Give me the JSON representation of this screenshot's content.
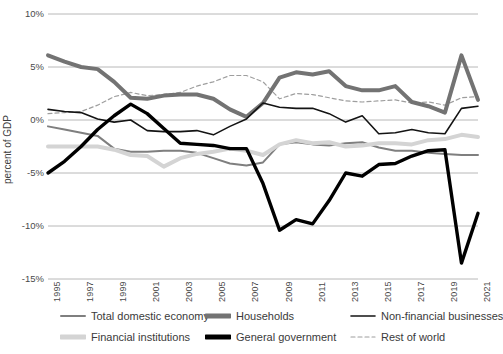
{
  "chart_data": {
    "type": "line",
    "title": "",
    "xlabel": "",
    "ylabel": "percent of GDP",
    "ylim": [
      -15,
      10
    ],
    "xlim": [
      1995,
      2021
    ],
    "grid": true,
    "legend_position": "bottom",
    "ytick_labels": [
      "10%",
      "5%",
      "0%",
      "-5%",
      "-10%",
      "-15%"
    ],
    "ytick_values": [
      10,
      5,
      0,
      -5,
      -10,
      -15
    ],
    "xtick_labels": [
      "1995",
      "1997",
      "1999",
      "2001",
      "2003",
      "2005",
      "2007",
      "2009",
      "2011",
      "2013",
      "2015",
      "2017",
      "2019",
      "2021"
    ],
    "x": [
      1995,
      1996,
      1997,
      1998,
      1999,
      2000,
      2001,
      2002,
      2003,
      2004,
      2005,
      2006,
      2007,
      2008,
      2009,
      2010,
      2011,
      2012,
      2013,
      2014,
      2015,
      2016,
      2017,
      2018,
      2019,
      2020,
      2021
    ],
    "series": [
      {
        "name": "Total domestic economy",
        "color": "#7f7f7f",
        "style": "solid",
        "width": 2,
        "values": [
          -0.6,
          -0.9,
          -1.2,
          -1.5,
          -2.7,
          -3.0,
          -3.0,
          -2.9,
          -2.9,
          -3.1,
          -3.6,
          -4.1,
          -4.3,
          -4.0,
          -2.3,
          -2.1,
          -2.3,
          -2.4,
          -2.2,
          -2.1,
          -2.6,
          -2.9,
          -2.9,
          -3.1,
          -3.2,
          -3.3,
          -3.3
        ]
      },
      {
        "name": "Households",
        "color": "#737373",
        "style": "solid",
        "width": 4,
        "values": [
          6.1,
          5.5,
          5.0,
          4.8,
          3.6,
          2.1,
          2.0,
          2.3,
          2.4,
          2.4,
          2.0,
          1.0,
          0.3,
          1.6,
          4.0,
          4.5,
          4.3,
          4.6,
          3.2,
          2.8,
          2.8,
          3.2,
          1.7,
          1.3,
          0.7,
          6.1,
          1.9
        ]
      },
      {
        "name": "Non-financial businesses",
        "color": "#141414",
        "style": "solid",
        "width": 1.6,
        "values": [
          1.0,
          0.8,
          0.7,
          0.1,
          -0.2,
          0.0,
          -1.0,
          -1.1,
          -1.1,
          -1.0,
          -1.4,
          -0.6,
          0.1,
          1.6,
          1.2,
          1.1,
          1.1,
          0.6,
          -0.2,
          0.4,
          -1.3,
          -1.2,
          -0.9,
          -1.2,
          -1.3,
          1.1,
          1.3
        ]
      },
      {
        "name": "Financial institutions",
        "color": "#d4d4d4",
        "style": "solid",
        "width": 4,
        "values": [
          -2.5,
          -2.5,
          -2.5,
          -2.5,
          -2.8,
          -3.3,
          -3.4,
          -4.4,
          -3.6,
          -3.2,
          -3.0,
          -2.7,
          -2.9,
          -3.3,
          -2.3,
          -1.9,
          -2.2,
          -2.1,
          -2.5,
          -2.4,
          -2.2,
          -2.2,
          -2.3,
          -1.9,
          -1.8,
          -1.4,
          -1.6
        ]
      },
      {
        "name": "General government",
        "color": "#000000",
        "style": "solid",
        "width": 3.4,
        "values": [
          -5.0,
          -3.9,
          -2.5,
          -0.9,
          0.4,
          1.5,
          0.6,
          -0.8,
          -2.2,
          -2.3,
          -2.4,
          -2.7,
          -2.7,
          -6.0,
          -10.4,
          -9.4,
          -9.8,
          -7.6,
          -5.0,
          -5.3,
          -4.2,
          -4.1,
          -3.4,
          -2.9,
          -2.8,
          -13.5,
          -8.8
        ]
      },
      {
        "name": "Rest of world",
        "color": "#9e9e9e",
        "style": "dashed",
        "width": 1.2,
        "values": [
          0.6,
          0.7,
          0.8,
          1.4,
          2.2,
          2.6,
          2.3,
          2.4,
          2.6,
          3.2,
          3.6,
          4.2,
          4.2,
          3.6,
          2.0,
          2.5,
          2.4,
          2.1,
          1.8,
          1.7,
          1.8,
          1.9,
          1.6,
          1.7,
          1.4,
          2.1,
          2.2
        ]
      }
    ],
    "legend": [
      {
        "label": "Total domestic economy",
        "color": "#7f7f7f",
        "style": "solid",
        "width": 2
      },
      {
        "label": "Households",
        "color": "#737373",
        "style": "solid",
        "width": 5
      },
      {
        "label": "Non-financial businesses",
        "color": "#141414",
        "style": "solid",
        "width": 1.6
      },
      {
        "label": "Financial institutions",
        "color": "#d4d4d4",
        "style": "solid",
        "width": 5
      },
      {
        "label": "General government",
        "color": "#000000",
        "style": "solid",
        "width": 5
      },
      {
        "label": "Rest of world",
        "color": "#9e9e9e",
        "style": "dashed",
        "width": 1.2
      }
    ],
    "colors": {
      "gridline": "#b0b0b0",
      "axis_text": "#4a4a4a",
      "background": "#ffffff"
    }
  }
}
